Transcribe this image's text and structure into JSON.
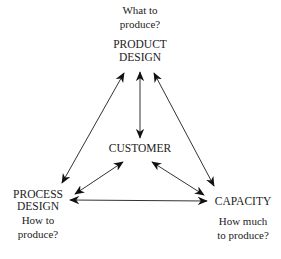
{
  "diagram": {
    "title": "",
    "colors": {
      "text": "#222222",
      "line": "#333333",
      "background": "#ffffff"
    },
    "nodes": {
      "product": {
        "label_line1": "PRODUCT",
        "label_line2": "DESIGN",
        "question_line1": "What to",
        "question_line2": "produce?"
      },
      "customer": {
        "label": "CUSTOMER"
      },
      "process": {
        "label_line1": "PROCESS",
        "label_line2": "DESIGN",
        "question_line1": "How to",
        "question_line2": "produce?"
      },
      "capacity": {
        "label": "CAPACITY",
        "question_line1": "How much",
        "question_line2": "to produce?"
      }
    },
    "edges": [
      {
        "from": "product",
        "to": "customer",
        "type": "bidirectional"
      },
      {
        "from": "product",
        "to": "process",
        "type": "bidirectional"
      },
      {
        "from": "product",
        "to": "capacity",
        "type": "bidirectional"
      },
      {
        "from": "customer",
        "to": "process",
        "type": "bidirectional"
      },
      {
        "from": "customer",
        "to": "capacity",
        "type": "bidirectional"
      },
      {
        "from": "process",
        "to": "capacity",
        "type": "bidirectional"
      }
    ]
  }
}
